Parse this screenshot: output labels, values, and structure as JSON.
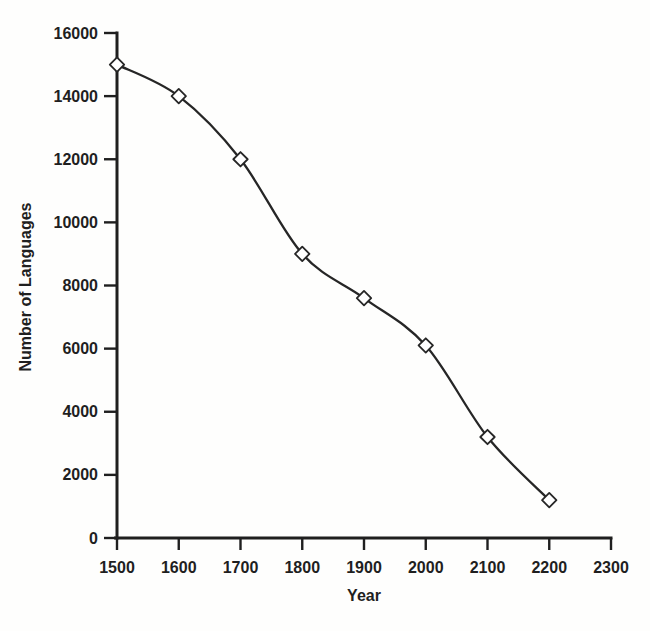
{
  "chart_data": {
    "type": "line",
    "title": "",
    "xlabel": "Year",
    "ylabel": "Number of Languages",
    "x": [
      1500,
      1600,
      1700,
      1800,
      1900,
      2000,
      2100,
      2200
    ],
    "y": [
      15000,
      14000,
      12000,
      9000,
      7600,
      6100,
      3200,
      1200
    ],
    "xlim": [
      1500,
      2300
    ],
    "ylim": [
      0,
      16000
    ],
    "xticks": [
      1500,
      1600,
      1700,
      1800,
      1900,
      2000,
      2100,
      2200,
      2300
    ],
    "yticks": [
      0,
      2000,
      4000,
      6000,
      8000,
      10000,
      12000,
      14000,
      16000
    ],
    "grid": false,
    "legend": null,
    "marker": "open-diamond",
    "line_color": "#262626",
    "axis_color": "#1f1f1f",
    "marker_fill": "#ffffff",
    "background": "#fefefd"
  }
}
